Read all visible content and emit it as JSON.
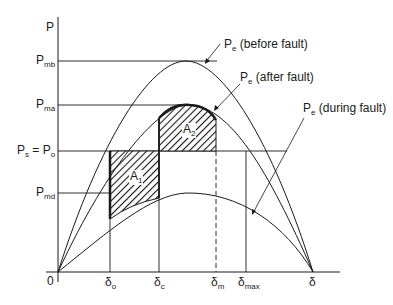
{
  "diagram": {
    "type": "power-angle equal-area criterion",
    "axis": {
      "y_label": "P",
      "origin_label": "0",
      "x_end_label": "δ"
    },
    "y_levels": [
      {
        "id": "pmb",
        "main": "P",
        "sub": "mb"
      },
      {
        "id": "pma",
        "main": "P",
        "sub": "ma"
      },
      {
        "id": "ps_po",
        "main": "P",
        "sub": "s",
        "eq": " = P",
        "sub2": "o"
      },
      {
        "id": "pmd",
        "main": "P",
        "sub": "md"
      }
    ],
    "x_marks": [
      {
        "id": "delta_o",
        "main": "δ",
        "sub": "o"
      },
      {
        "id": "delta_c",
        "main": "δ",
        "sub": "c"
      },
      {
        "id": "delta_m",
        "main": "δ",
        "sub": "m",
        "style": "dashed"
      },
      {
        "id": "delta_max",
        "main": "δ",
        "sub": "max"
      }
    ],
    "curves": [
      {
        "id": "before",
        "main": "P",
        "sub": "e",
        "text": " (before fault)"
      },
      {
        "id": "after",
        "main": "P",
        "sub": "e",
        "text": " (after fault)"
      },
      {
        "id": "during",
        "main": "P",
        "sub": "e",
        "text": " (during fault)"
      }
    ],
    "areas": [
      {
        "id": "a1",
        "main": "A",
        "sub": "1",
        "description": "accelerating area between Ps line and during-fault curve from δo to δc"
      },
      {
        "id": "a2",
        "main": "A",
        "sub": "2",
        "description": "decelerating area between after-fault curve and Ps line from δc to δm"
      }
    ],
    "colors": {
      "line": "#1a1a1a",
      "background": "#ffffff"
    }
  }
}
